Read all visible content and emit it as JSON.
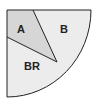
{
  "diagram": {
    "type": "quarter-circle-sector-partition",
    "regions": [
      {
        "id": "A",
        "label": "A",
        "fill": "#d9d9d9"
      },
      {
        "id": "B",
        "label": "B",
        "fill": "#ececec"
      },
      {
        "id": "BR",
        "label": "BR",
        "fill": "#ececec"
      }
    ],
    "stroke_color": "#222222"
  }
}
